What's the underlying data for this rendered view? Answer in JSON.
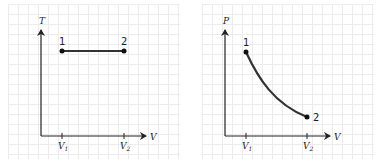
{
  "figures": [
    {
      "id": "tv-diagram",
      "y_axis_label": "T",
      "x_axis_label": "V",
      "x_ticks": [
        {
          "base": "V",
          "sub": "1"
        },
        {
          "base": "V",
          "sub": "2"
        }
      ],
      "points": [
        {
          "label": "1"
        },
        {
          "label": "2"
        }
      ],
      "process": "constant temperature (horizontal line)"
    },
    {
      "id": "pv-diagram",
      "y_axis_label": "P",
      "x_axis_label": "V",
      "x_ticks": [
        {
          "base": "V",
          "sub": "1"
        },
        {
          "base": "V",
          "sub": "2"
        }
      ],
      "points": [
        {
          "label": "1"
        },
        {
          "label": "2"
        }
      ],
      "process": "isothermal expansion (hyperbolic curve)"
    }
  ],
  "colors": {
    "curve": "#333333",
    "axis": "#222222",
    "grid": "#ececec"
  }
}
